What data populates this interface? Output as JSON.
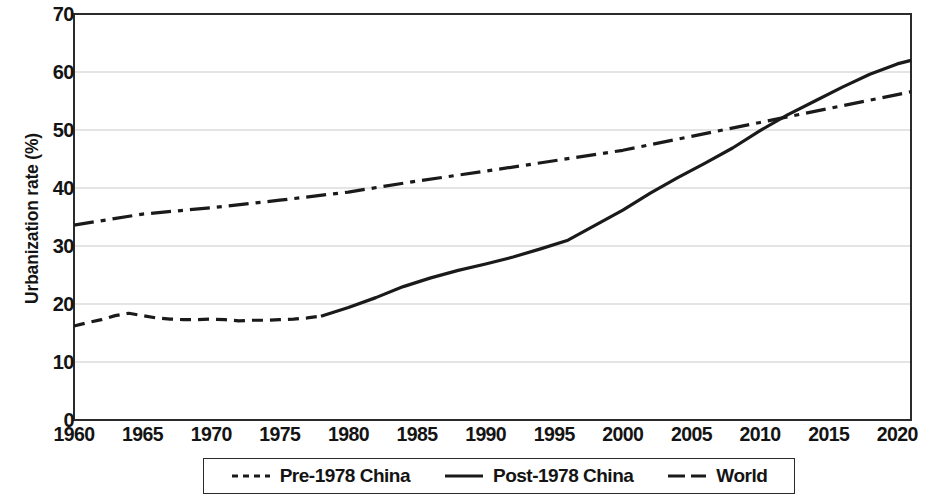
{
  "chart_data": {
    "type": "line",
    "title": "",
    "xlabel": "",
    "ylabel": "Urbanization rate (%)",
    "xlim": [
      1960,
      2021
    ],
    "ylim": [
      0,
      70
    ],
    "ytick_labels": [
      "0",
      "10",
      "20",
      "30",
      "40",
      "50",
      "60",
      "70"
    ],
    "ytick_values": [
      0,
      10,
      20,
      30,
      40,
      50,
      60,
      70
    ],
    "xtick_labels": [
      "1960",
      "1965",
      "1970",
      "1975",
      "1980",
      "1985",
      "1990",
      "1995",
      "2000",
      "2005",
      "2010",
      "2015",
      "2020"
    ],
    "xtick_values": [
      1960,
      1965,
      1970,
      1975,
      1980,
      1985,
      1990,
      1995,
      2000,
      2005,
      2010,
      2015,
      2020
    ],
    "grid": "horizontal",
    "legend_position": "below-center",
    "series": [
      {
        "name": "Pre-1978 China",
        "style": "dashed",
        "color": "#1a1a1a",
        "x": [
          1960,
          1961,
          1962,
          1963,
          1964,
          1965,
          1966,
          1967,
          1968,
          1969,
          1970,
          1971,
          1972,
          1973,
          1974,
          1975,
          1976,
          1977,
          1978
        ],
        "values": [
          16.2,
          16.8,
          17.3,
          18.0,
          18.4,
          18.0,
          17.6,
          17.4,
          17.3,
          17.3,
          17.4,
          17.3,
          17.1,
          17.2,
          17.2,
          17.3,
          17.4,
          17.6,
          17.9
        ]
      },
      {
        "name": "Post-1978 China",
        "style": "solid",
        "color": "#1a1a1a",
        "x": [
          1978,
          1980,
          1982,
          1984,
          1986,
          1988,
          1990,
          1992,
          1994,
          1996,
          1998,
          2000,
          2002,
          2004,
          2006,
          2008,
          2010,
          2012,
          2014,
          2016,
          2018,
          2020,
          2021
        ],
        "values": [
          17.9,
          19.4,
          21.1,
          23.0,
          24.5,
          25.8,
          26.9,
          28.1,
          29.5,
          31.0,
          33.6,
          36.2,
          39.1,
          41.8,
          44.3,
          46.9,
          49.9,
          52.6,
          55.0,
          57.4,
          59.6,
          61.4,
          62.0
        ]
      },
      {
        "name": "World",
        "style": "dash-dot",
        "color": "#1a1a1a",
        "x": [
          1960,
          1965,
          1970,
          1975,
          1980,
          1985,
          1990,
          1995,
          2000,
          2005,
          2010,
          2015,
          2020,
          2021
        ],
        "values": [
          33.6,
          35.5,
          36.6,
          37.9,
          39.3,
          41.2,
          42.9,
          44.7,
          46.5,
          48.9,
          51.3,
          53.7,
          56.1,
          56.6
        ]
      }
    ]
  },
  "axis": {
    "y_title": "Urbanization rate (%)"
  },
  "legend": {
    "items": [
      {
        "label": "Pre-1978 China",
        "style": "dashed"
      },
      {
        "label": "Post-1978 China",
        "style": "solid"
      },
      {
        "label": "World",
        "style": "dash-dot"
      }
    ]
  }
}
